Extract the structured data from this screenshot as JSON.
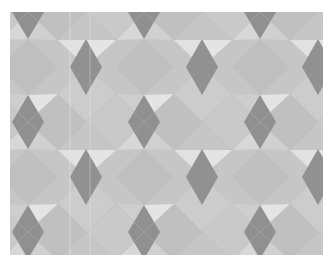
{
  "image": {
    "description": "Geometric tessellation of gray tiles: dark rhombi in a staggered lattice surrounded by mid-gray squares and light triangles",
    "colors": {
      "dark_rhombus": "#8d8d8d",
      "square": "#bebebe",
      "square_alt": "#c7c7c7",
      "triangle_light": "#e3e3e3",
      "triangle_mid": "#cdcdcd",
      "edge": "#b0b0b0"
    },
    "lattice": {
      "period_x": 116,
      "period_y": 110,
      "offset_x": 20,
      "offset_y": 12
    }
  }
}
